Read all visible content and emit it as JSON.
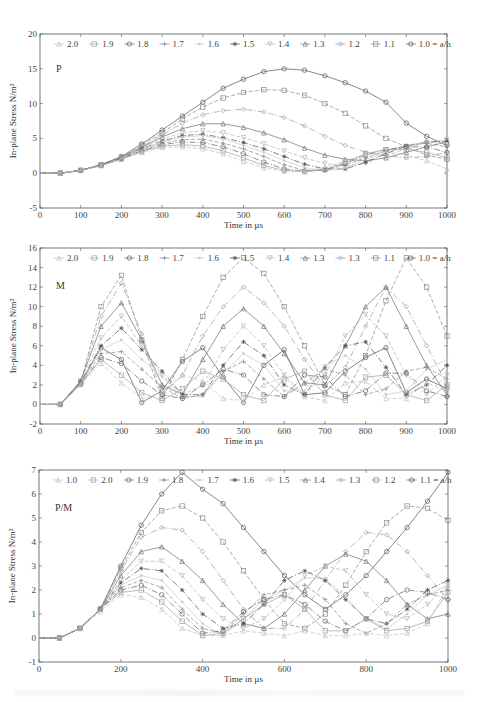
{
  "chart_data": [
    {
      "type": "line",
      "panel_label": "P",
      "xlabel": "Time in µs",
      "ylabel": "In-plane Stress N/m²",
      "xlim": [
        0,
        1000
      ],
      "ylim": [
        -5,
        20
      ],
      "xticks": [
        0,
        100,
        200,
        300,
        400,
        500,
        600,
        700,
        800,
        900,
        1000
      ],
      "yticks": [
        -5,
        0,
        5,
        10,
        15,
        20
      ],
      "legend_position": "top-inside",
      "legend": [
        "2.0",
        "1.9",
        "1.8",
        "1.7",
        "1.6",
        "1.5",
        "1.4",
        "1.3",
        "1.2",
        "1.1",
        "1.0 = a/h"
      ],
      "x": [
        0,
        50,
        100,
        150,
        200,
        250,
        300,
        350,
        400,
        450,
        500,
        550,
        600,
        650,
        700,
        750,
        800,
        850,
        900,
        950,
        1000
      ],
      "series": [
        {
          "name": "1.0",
          "values": [
            0,
            0,
            0.4,
            1.2,
            2.4,
            4.2,
            6.2,
            8.2,
            10.2,
            12.2,
            13.5,
            14.6,
            15.0,
            14.8,
            14.0,
            13.0,
            11.8,
            10.2,
            7.2,
            5.3,
            4.0
          ]
        },
        {
          "name": "1.1",
          "values": [
            0,
            0,
            0.4,
            1.2,
            2.3,
            4.0,
            5.8,
            7.8,
            9.5,
            10.8,
            11.6,
            12.0,
            11.9,
            11.2,
            10.0,
            8.6,
            6.8,
            5.0,
            3.8,
            2.6,
            2.0
          ]
        },
        {
          "name": "1.2",
          "values": [
            0,
            0,
            0.4,
            1.2,
            2.3,
            3.8,
            5.5,
            7.2,
            8.4,
            9.0,
            9.2,
            8.8,
            8.0,
            6.8,
            5.3,
            4.0,
            3.0,
            2.5,
            2.2,
            2.4,
            3.0
          ]
        },
        {
          "name": "1.3",
          "values": [
            0,
            0,
            0.4,
            1.2,
            2.3,
            3.7,
            5.2,
            6.4,
            7.1,
            7.1,
            6.6,
            5.8,
            4.8,
            3.6,
            2.6,
            2.0,
            1.8,
            2.2,
            3.0,
            3.8,
            4.5
          ]
        },
        {
          "name": "1.4",
          "values": [
            0,
            0,
            0.4,
            1.2,
            2.2,
            3.6,
            4.9,
            5.8,
            6.1,
            5.8,
            5.1,
            4.2,
            3.2,
            2.2,
            1.4,
            1.0,
            1.4,
            2.4,
            3.6,
            4.4,
            4.8
          ]
        },
        {
          "name": "1.5",
          "values": [
            0,
            0,
            0.4,
            1.2,
            2.2,
            3.5,
            4.6,
            5.4,
            5.6,
            5.1,
            4.4,
            3.5,
            2.4,
            1.3,
            0.6,
            0.6,
            1.6,
            2.8,
            3.9,
            4.5,
            4.6
          ]
        },
        {
          "name": "1.6",
          "values": [
            0,
            0,
            0.4,
            1.1,
            2.2,
            3.4,
            4.5,
            5.2,
            5.4,
            4.9,
            4.0,
            3.0,
            1.8,
            0.8,
            0.3,
            0.8,
            2.0,
            3.0,
            4.0,
            4.5,
            4.3
          ]
        },
        {
          "name": "1.7",
          "values": [
            0,
            0,
            0.4,
            1.1,
            2.1,
            3.3,
            4.3,
            4.8,
            4.9,
            4.3,
            3.5,
            2.4,
            1.2,
            0.4,
            0.4,
            1.2,
            2.2,
            3.2,
            4.0,
            4.3,
            3.8
          ]
        },
        {
          "name": "1.8",
          "values": [
            0,
            0,
            0.4,
            1.1,
            2.1,
            3.2,
            4.1,
            4.5,
            4.4,
            3.8,
            2.8,
            1.6,
            0.6,
            0.3,
            0.5,
            1.4,
            2.6,
            3.4,
            3.8,
            3.8,
            3.0
          ]
        },
        {
          "name": "1.9",
          "values": [
            0,
            0,
            0.4,
            1.1,
            2.0,
            3.1,
            3.9,
            4.1,
            3.9,
            3.2,
            2.2,
            1.1,
            0.4,
            0.2,
            0.5,
            1.6,
            2.8,
            3.4,
            3.4,
            3.0,
            2.2
          ]
        },
        {
          "name": "2.0",
          "values": [
            0,
            0,
            0.4,
            1.1,
            2.0,
            3.0,
            3.7,
            3.8,
            3.5,
            2.8,
            1.7,
            0.8,
            0.3,
            0.3,
            0.8,
            1.8,
            2.7,
            3.0,
            2.6,
            1.8,
            0.6
          ]
        }
      ]
    },
    {
      "type": "line",
      "panel_label": "M",
      "xlabel": "Time in µs",
      "ylabel": "In-plane Stress N/m²",
      "xlim": [
        0,
        1000
      ],
      "ylim": [
        -2,
        16
      ],
      "xticks": [
        0,
        100,
        200,
        300,
        400,
        500,
        600,
        700,
        800,
        900,
        1000
      ],
      "yticks": [
        -2,
        0,
        2,
        4,
        6,
        8,
        10,
        12,
        14,
        16
      ],
      "legend_position": "top-inside",
      "legend": [
        "2.0",
        "1.9",
        "1.8",
        "1.7",
        "1.6",
        "1.5",
        "1.4",
        "1.3",
        "1.3",
        "1.1",
        "1.0 = a/h"
      ],
      "x": [
        0,
        50,
        100,
        150,
        200,
        250,
        300,
        350,
        400,
        450,
        500,
        550,
        600,
        650,
        700,
        750,
        800,
        850,
        900,
        950,
        1000
      ],
      "series": [
        {
          "name": "1.0",
          "values": [
            0,
            0,
            2.2,
            5.8,
            4.6,
            0.2,
            1.4,
            4.4,
            5.8,
            2.8,
            0.2,
            4.0,
            5.6,
            1.0,
            1.2,
            3.4,
            4.8,
            5.8,
            1.2,
            2.6,
            1.6
          ]
        },
        {
          "name": "1.1",
          "values": [
            0,
            0,
            2.3,
            10.0,
            13.2,
            6.6,
            0.6,
            4.6,
            9.0,
            13.0,
            15.0,
            13.4,
            10.0,
            6.0,
            2.0,
            1.0,
            5.0,
            10.6,
            15.0,
            12.0,
            7.0
          ]
        },
        {
          "name": "1.2",
          "values": [
            0,
            0,
            2.4,
            9.0,
            12.4,
            7.2,
            1.0,
            3.0,
            7.0,
            10.0,
            12.0,
            10.4,
            8.0,
            4.6,
            1.8,
            3.8,
            8.0,
            12.0,
            10.0,
            6.0,
            2.0
          ]
        },
        {
          "name": "1.3",
          "values": [
            0,
            0,
            2.4,
            8.0,
            10.4,
            6.6,
            2.0,
            1.0,
            4.6,
            8.0,
            9.8,
            8.0,
            5.2,
            2.2,
            2.0,
            6.0,
            10.0,
            12.0,
            8.0,
            4.0,
            1.0
          ]
        },
        {
          "name": "1.4",
          "values": [
            0,
            0,
            2.4,
            6.8,
            9.0,
            6.0,
            3.0,
            1.0,
            2.0,
            5.6,
            8.0,
            6.0,
            3.0,
            1.0,
            3.0,
            7.0,
            9.2,
            7.0,
            3.0,
            1.0,
            3.0
          ]
        },
        {
          "name": "1.5",
          "values": [
            0,
            0,
            2.3,
            6.0,
            7.8,
            5.6,
            3.4,
            1.0,
            1.0,
            4.0,
            6.4,
            5.0,
            2.0,
            1.0,
            3.8,
            6.0,
            6.4,
            3.8,
            1.0,
            2.0,
            4.0
          ]
        },
        {
          "name": "1.6",
          "values": [
            0,
            0,
            2.2,
            5.6,
            6.6,
            4.6,
            2.8,
            0.8,
            0.8,
            3.2,
            5.2,
            4.0,
            1.4,
            1.4,
            4.0,
            5.0,
            3.6,
            1.0,
            1.4,
            3.6,
            4.6
          ]
        },
        {
          "name": "1.7",
          "values": [
            0,
            0,
            2.2,
            5.2,
            5.4,
            3.6,
            1.8,
            0.6,
            1.0,
            3.4,
            4.4,
            2.6,
            0.8,
            2.2,
            3.6,
            3.0,
            1.0,
            1.6,
            3.4,
            3.8,
            2.6
          ]
        },
        {
          "name": "1.8",
          "values": [
            0,
            0,
            2.1,
            4.8,
            4.2,
            2.4,
            1.0,
            0.6,
            2.0,
            3.6,
            3.0,
            1.0,
            0.8,
            3.0,
            2.8,
            0.8,
            1.4,
            3.2,
            3.2,
            1.4,
            0.8
          ]
        },
        {
          "name": "1.9",
          "values": [
            0,
            0,
            2.1,
            4.6,
            3.0,
            1.2,
            0.4,
            1.6,
            3.4,
            2.6,
            1.0,
            0.4,
            2.6,
            3.4,
            1.0,
            0.4,
            2.8,
            3.0,
            1.0,
            0.4,
            2.0
          ]
        },
        {
          "name": "2.0",
          "values": [
            0,
            0,
            2.0,
            4.2,
            2.2,
            0.6,
            1.2,
            3.0,
            2.4,
            0.6,
            0.4,
            2.0,
            2.8,
            0.8,
            0.4,
            2.2,
            2.4,
            0.6,
            0.6,
            2.2,
            1.4
          ]
        }
      ]
    },
    {
      "type": "line",
      "panel_label": "P/M",
      "xlabel": "Time in µs",
      "ylabel": "In-plane Stress N/m²",
      "xlim": [
        0,
        1000
      ],
      "ylim": [
        -1,
        7
      ],
      "xticks": [
        0,
        200,
        400,
        600,
        800,
        1000
      ],
      "yticks": [
        -1,
        0,
        1,
        2,
        3,
        4,
        5,
        6,
        7
      ],
      "legend_position": "top-inside",
      "legend": [
        "1.0",
        "2.0",
        "1.9",
        "1.8",
        "1.7",
        "1.6",
        "1.5",
        "1.4",
        "1.3",
        "1.2",
        "1.1 = a/h"
      ],
      "x": [
        0,
        50,
        100,
        150,
        200,
        250,
        300,
        350,
        400,
        450,
        500,
        550,
        600,
        650,
        700,
        750,
        800,
        850,
        900,
        950,
        1000
      ],
      "series": [
        {
          "name": "1.0",
          "values": [
            0,
            0,
            0.4,
            1.2,
            3.0,
            4.7,
            6.0,
            6.9,
            6.2,
            5.6,
            4.6,
            3.6,
            2.6,
            1.8,
            1.2,
            1.8,
            2.6,
            3.6,
            4.6,
            5.7,
            6.9
          ]
        },
        {
          "name": "1.1",
          "values": [
            0,
            0,
            0.4,
            1.2,
            2.9,
            4.4,
            5.3,
            5.5,
            5.0,
            4.0,
            2.8,
            1.6,
            0.6,
            0.4,
            1.0,
            2.2,
            3.6,
            4.8,
            5.5,
            5.4,
            4.9
          ]
        },
        {
          "name": "1.2",
          "values": [
            0,
            0,
            0.4,
            1.2,
            2.8,
            4.2,
            4.6,
            4.5,
            3.6,
            2.4,
            1.2,
            0.4,
            0.4,
            1.2,
            2.4,
            3.6,
            4.4,
            4.3,
            3.6,
            2.6,
            1.6
          ]
        },
        {
          "name": "1.3",
          "values": [
            0,
            0,
            0.4,
            1.2,
            2.6,
            3.6,
            3.8,
            3.2,
            2.4,
            1.4,
            0.6,
            0.4,
            1.0,
            2.0,
            3.0,
            3.5,
            3.2,
            2.4,
            1.4,
            0.8,
            1.0
          ]
        },
        {
          "name": "1.4",
          "values": [
            0,
            0,
            0.4,
            1.2,
            2.4,
            3.2,
            3.2,
            2.6,
            1.6,
            0.8,
            0.4,
            0.8,
            1.6,
            2.6,
            3.0,
            2.8,
            1.8,
            1.0,
            0.8,
            1.4,
            2.2
          ]
        },
        {
          "name": "1.5",
          "values": [
            0,
            0,
            0.4,
            1.2,
            2.3,
            2.9,
            2.8,
            2.0,
            1.0,
            0.4,
            0.6,
            1.4,
            2.4,
            2.8,
            2.4,
            1.6,
            0.8,
            0.6,
            1.2,
            2.0,
            2.4
          ]
        },
        {
          "name": "1.6",
          "values": [
            0,
            0,
            0.4,
            1.2,
            2.2,
            2.6,
            2.4,
            1.5,
            0.6,
            0.1,
            0.8,
            1.6,
            2.0,
            2.5,
            2.5,
            1.7,
            0.8,
            0.4,
            1.0,
            1.8,
            2.2
          ]
        },
        {
          "name": "1.7",
          "values": [
            0,
            0,
            0.4,
            1.2,
            2.1,
            2.4,
            2.1,
            1.2,
            0.4,
            0.2,
            1.0,
            1.8,
            2.0,
            2.2,
            1.6,
            0.6,
            0.2,
            0.6,
            1.4,
            1.8,
            2.0
          ]
        },
        {
          "name": "1.8",
          "values": [
            0,
            0,
            0.4,
            1.2,
            2.0,
            2.2,
            1.8,
            1.0,
            0.2,
            0.3,
            1.1,
            1.6,
            1.8,
            1.4,
            0.7,
            0.3,
            0.8,
            1.6,
            2.0,
            1.9,
            1.6
          ]
        },
        {
          "name": "1.9",
          "values": [
            0,
            0,
            0.4,
            1.2,
            1.9,
            2.0,
            1.5,
            0.7,
            0.1,
            0.2,
            0.8,
            1.4,
            1.8,
            1.2,
            0.3,
            0.3,
            0.8,
            0.3,
            0.4,
            0.7,
            1.9
          ]
        },
        {
          "name": "2.0",
          "values": [
            0,
            0,
            0.4,
            1.1,
            1.8,
            1.7,
            1.2,
            0.4,
            0.1,
            0.1,
            0.3,
            0.2,
            0.1,
            0.3,
            0.1,
            0.1,
            0.2,
            0.1,
            0.2,
            0.6,
            2.2
          ]
        }
      ]
    }
  ],
  "panels": [
    {
      "label": "P",
      "xlabel": "Time in µs",
      "ylabel": "In-plane Stress N/m²"
    },
    {
      "label": "M",
      "xlabel": "Time in µs",
      "ylabel": "In-plane Stress N/m²"
    },
    {
      "label": "P/M",
      "xlabel": "Time in µs",
      "ylabel": "In-plane Stress N/m²"
    }
  ],
  "colors": {
    "axis": "#555555",
    "series_dark": "#444444",
    "series_mid": "#8a8a8a",
    "series_light": "#c4c4c4"
  }
}
